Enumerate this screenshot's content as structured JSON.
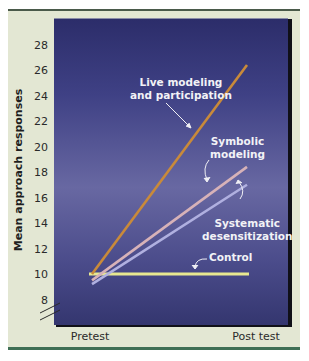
{
  "chart_data": {
    "type": "line",
    "title": "",
    "xlabel": "",
    "ylabel": "Mean approach responses",
    "categories": [
      "Pretest",
      "Post test"
    ],
    "yticks": [
      8,
      10,
      12,
      14,
      16,
      18,
      20,
      22,
      24,
      26,
      28
    ],
    "ylim": [
      7,
      29
    ],
    "grid": false,
    "legend": "inline labels",
    "series": [
      {
        "name": "Live modeling and participation",
        "values": [
          10,
          26.4
        ],
        "color": "#c98a3a"
      },
      {
        "name": "Symbolic modeling",
        "values": [
          9.5,
          18.4
        ],
        "color": "#d7b2b8"
      },
      {
        "name": "Systematic desensitization",
        "values": [
          9.2,
          17
        ],
        "color": "#b0b0e0"
      },
      {
        "name": "Control",
        "values": [
          10,
          10
        ],
        "color": "#e8e890"
      }
    ]
  },
  "labels": {
    "live": [
      "Live modeling",
      "and participation"
    ],
    "symbolic": [
      "Symbolic",
      "modeling"
    ],
    "systematic": [
      "Systematic",
      "desensitization"
    ],
    "control": "Control"
  },
  "axis": {
    "ylabel": "Mean approach responses",
    "ticks": [
      "28",
      "26",
      "24",
      "22",
      "20",
      "18",
      "16",
      "14",
      "12",
      "10",
      "8"
    ],
    "x": [
      "Pretest",
      "Post test"
    ]
  }
}
